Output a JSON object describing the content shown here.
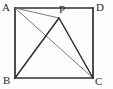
{
  "figure": {
    "background_color": "#fdfdfd",
    "stroke_color_heavy": "#2f2f2f",
    "stroke_color_light": "#6b6b6b",
    "labels": {
      "a": "A",
      "b": "B",
      "c": "C",
      "d": "D",
      "p": "P"
    },
    "points": {
      "A": {
        "x": 15,
        "y": 8
      },
      "D": {
        "x": 93,
        "y": 8
      },
      "B": {
        "x": 15,
        "y": 78
      },
      "C": {
        "x": 93,
        "y": 78
      },
      "P": {
        "x": 59,
        "y": 18
      }
    },
    "segments": [
      {
        "name": "side-AD",
        "from": "A",
        "to": "D",
        "weight": "heavy"
      },
      {
        "name": "side-DC",
        "from": "D",
        "to": "C",
        "weight": "heavy"
      },
      {
        "name": "side-CB",
        "from": "C",
        "to": "B",
        "weight": "heavy"
      },
      {
        "name": "side-BA",
        "from": "B",
        "to": "A",
        "weight": "heavy"
      },
      {
        "name": "segment-AP",
        "from": "A",
        "to": "P",
        "weight": "light"
      },
      {
        "name": "diagonal-AC",
        "from": "A",
        "to": "C",
        "weight": "light"
      },
      {
        "name": "segment-PB",
        "from": "P",
        "to": "B",
        "weight": "heavy"
      },
      {
        "name": "segment-PC",
        "from": "P",
        "to": "C",
        "weight": "heavy"
      }
    ]
  }
}
